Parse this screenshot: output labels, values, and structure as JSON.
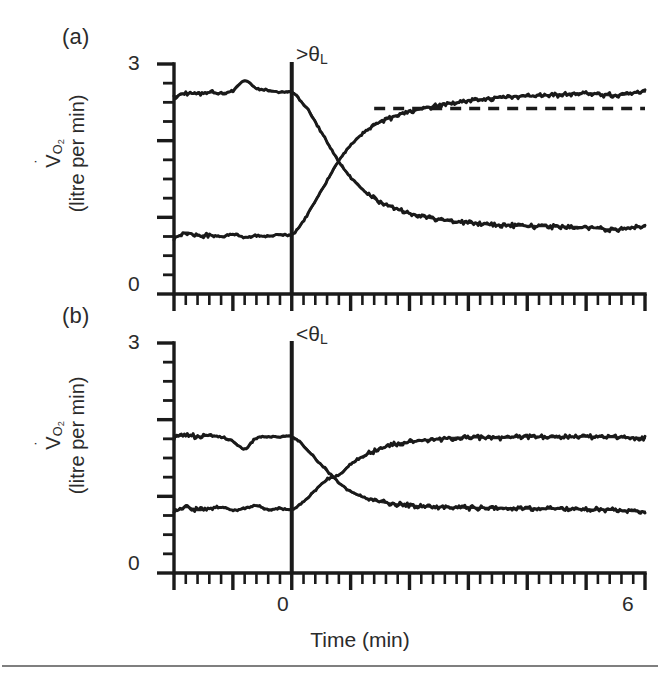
{
  "figure": {
    "width": 660,
    "height": 681,
    "ink_color": "#1a1a1a",
    "background": "#ffffff",
    "axis_title_x": "Time (min)"
  },
  "panels": [
    {
      "id": "a",
      "label": "(a)",
      "annotation_prefix": ">",
      "annotation_symbol": "θ",
      "annotation_subscript": "L",
      "annotation_full": ">θL",
      "ylabel_line1_symbol": "V",
      "ylabel_line1_sub": "O",
      "ylabel_line1_sub2": "2",
      "ylabel_line2": "(litre per min)",
      "ytick_labels": [
        "3",
        "0"
      ]
    },
    {
      "id": "b",
      "label": "(b)",
      "annotation_prefix": "<",
      "annotation_symbol": "θ",
      "annotation_subscript": "L",
      "annotation_full": "<θL",
      "ylabel_line1_symbol": "V",
      "ylabel_line1_sub": "O",
      "ylabel_line1_sub2": "2",
      "ylabel_line2": "(litre per min)",
      "ytick_labels": [
        "3",
        "0"
      ]
    }
  ],
  "xtick_labels": {
    "zero": "0",
    "max": "6"
  },
  "chart_data": [
    {
      "type": "line",
      "panel": "a",
      "title": "(a)",
      "xlabel": "Time (min)",
      "ylabel": "VO2 (litre per min)",
      "xlim": [
        -2,
        6
      ],
      "ylim": [
        0,
        3
      ],
      "xticks_major": [
        -2,
        -1,
        0,
        1,
        2,
        3,
        4,
        5,
        6
      ],
      "xminor_per_major": 5,
      "yticks_major": [
        0,
        1,
        2,
        3
      ],
      "ytick_step_minor": 0.25,
      "xtick_labels_shown": [
        "0",
        "6"
      ],
      "ytick_labels_shown": [
        "0",
        "3"
      ],
      "grid": false,
      "legend": "none",
      "transition_time": 0,
      "annotation": ">θL",
      "series": [
        {
          "name": "off-transient (work-to-rest decay)",
          "style": "solid",
          "baseline": 2.6,
          "asymptote": 0.85,
          "time_constant_min": 0.75,
          "delay_min": 0.1,
          "x": [
            -2.0,
            -1.8,
            -1.6,
            -1.4,
            -1.2,
            -1.0,
            -0.8,
            -0.6,
            -0.4,
            -0.2,
            0.0,
            0.15,
            0.3,
            0.45,
            0.6,
            0.8,
            1.0,
            1.25,
            1.5,
            1.75,
            2.0,
            2.5,
            3.0,
            3.5,
            4.0,
            4.5,
            5.0,
            5.5,
            6.0
          ],
          "y": [
            2.57,
            2.62,
            2.61,
            2.63,
            2.62,
            2.65,
            2.78,
            2.68,
            2.66,
            2.63,
            2.64,
            2.52,
            2.38,
            2.18,
            1.98,
            1.72,
            1.52,
            1.33,
            1.2,
            1.12,
            1.05,
            0.97,
            0.93,
            0.9,
            0.89,
            0.88,
            0.87,
            0.84,
            0.88
          ]
        },
        {
          "name": "on-transient (rest-to-work rise, with slow component)",
          "style": "solid",
          "baseline": 0.75,
          "fast_asymptote": 2.42,
          "final_value": 2.62,
          "time_constant_min": 0.75,
          "delay_min": 0.1,
          "x": [
            -2.0,
            -1.8,
            -1.6,
            -1.4,
            -1.2,
            -1.0,
            -0.8,
            -0.6,
            -0.4,
            -0.2,
            0.0,
            0.15,
            0.3,
            0.45,
            0.6,
            0.8,
            1.0,
            1.25,
            1.5,
            1.75,
            2.0,
            2.5,
            3.0,
            3.5,
            4.0,
            4.5,
            5.0,
            5.5,
            6.0
          ],
          "y": [
            0.73,
            0.8,
            0.76,
            0.77,
            0.75,
            0.78,
            0.74,
            0.76,
            0.75,
            0.78,
            0.77,
            0.9,
            1.08,
            1.28,
            1.48,
            1.74,
            1.94,
            2.12,
            2.24,
            2.32,
            2.38,
            2.46,
            2.52,
            2.56,
            2.58,
            2.6,
            2.62,
            2.59,
            2.64
          ]
        },
        {
          "name": "fast-component asymptote",
          "style": "dashed",
          "x": [
            1.4,
            6.0
          ],
          "y": [
            2.42,
            2.42
          ]
        }
      ]
    },
    {
      "type": "line",
      "panel": "b",
      "title": "(b)",
      "xlabel": "Time (min)",
      "ylabel": "VO2 (litre per min)",
      "xlim": [
        -2,
        6
      ],
      "ylim": [
        0,
        3
      ],
      "xticks_major": [
        -2,
        -1,
        0,
        1,
        2,
        3,
        4,
        5,
        6
      ],
      "xminor_per_major": 5,
      "yticks_major": [
        0,
        1,
        2,
        3
      ],
      "ytick_step_minor": 0.25,
      "xtick_labels_shown": [
        "0",
        "6"
      ],
      "ytick_labels_shown": [
        "0",
        "3"
      ],
      "grid": false,
      "legend": "none",
      "transition_time": 0,
      "annotation": "<θL",
      "series": [
        {
          "name": "off-transient (work-to-rest decay)",
          "style": "solid",
          "baseline": 1.78,
          "asymptote": 0.84,
          "time_constant_min": 0.62,
          "delay_min": 0.1,
          "x": [
            -2.0,
            -1.8,
            -1.6,
            -1.4,
            -1.2,
            -1.0,
            -0.8,
            -0.6,
            -0.4,
            -0.2,
            0.0,
            0.15,
            0.3,
            0.45,
            0.6,
            0.8,
            1.0,
            1.25,
            1.5,
            1.75,
            2.0,
            2.5,
            3.0,
            3.5,
            4.0,
            4.5,
            5.0,
            5.5,
            6.0
          ],
          "y": [
            1.77,
            1.8,
            1.78,
            1.79,
            1.77,
            1.72,
            1.62,
            1.76,
            1.78,
            1.77,
            1.78,
            1.7,
            1.58,
            1.45,
            1.33,
            1.18,
            1.06,
            0.98,
            0.93,
            0.9,
            0.88,
            0.86,
            0.85,
            0.85,
            0.84,
            0.84,
            0.83,
            0.82,
            0.8
          ]
        },
        {
          "name": "on-transient (rest-to-work rise)",
          "style": "solid",
          "baseline": 0.82,
          "asymptote": 1.78,
          "time_constant_min": 0.62,
          "delay_min": 0.1,
          "x": [
            -2.0,
            -1.8,
            -1.6,
            -1.4,
            -1.2,
            -1.0,
            -0.8,
            -0.6,
            -0.4,
            -0.2,
            0.0,
            0.15,
            0.3,
            0.45,
            0.6,
            0.8,
            1.0,
            1.25,
            1.5,
            1.75,
            2.0,
            2.5,
            3.0,
            3.5,
            4.0,
            4.5,
            5.0,
            5.5,
            6.0
          ],
          "y": [
            0.8,
            0.86,
            0.82,
            0.84,
            0.86,
            0.82,
            0.84,
            0.88,
            0.83,
            0.84,
            0.83,
            0.9,
            1.0,
            1.12,
            1.22,
            1.28,
            1.42,
            1.54,
            1.62,
            1.68,
            1.71,
            1.75,
            1.77,
            1.76,
            1.78,
            1.77,
            1.78,
            1.77,
            1.76
          ]
        }
      ]
    }
  ]
}
